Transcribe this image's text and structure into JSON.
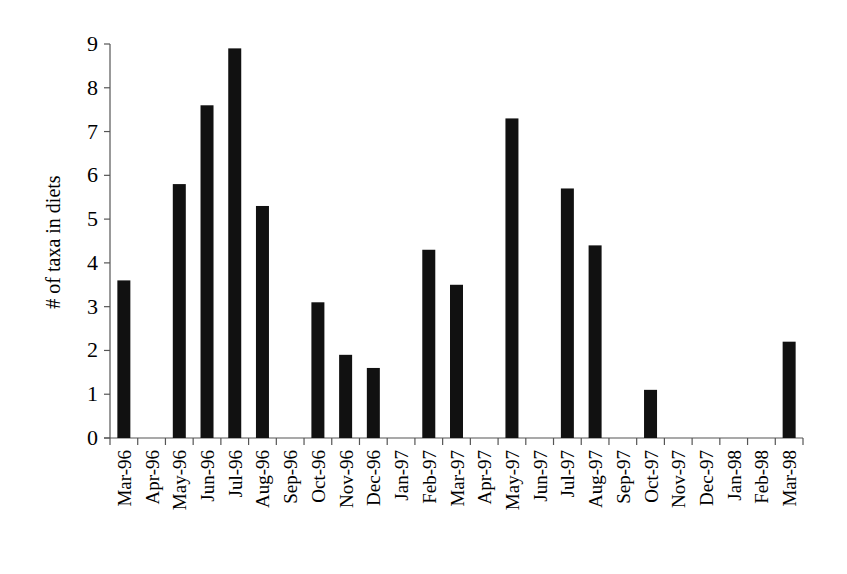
{
  "chart_data": {
    "type": "bar",
    "title": "",
    "xlabel": "",
    "ylabel": "# of taxa in diets",
    "ylim": [
      0,
      9
    ],
    "yticks": [
      0,
      1,
      2,
      3,
      4,
      5,
      6,
      7,
      8,
      9
    ],
    "grid": false,
    "legend": null,
    "bar_color": "#111111",
    "categories": [
      "Mar-96",
      "Apr-96",
      "May-96",
      "Jun-96",
      "Jul-96",
      "Aug-96",
      "Sep-96",
      "Oct-96",
      "Nov-96",
      "Dec-96",
      "Jan-97",
      "Feb-97",
      "Mar-97",
      "Apr-97",
      "May-97",
      "Jun-97",
      "Jul-97",
      "Aug-97",
      "Sep-97",
      "Oct-97",
      "Nov-97",
      "Dec-97",
      "Jan-98",
      "Feb-98",
      "Mar-98"
    ],
    "values": [
      3.6,
      0,
      5.8,
      7.6,
      8.9,
      5.3,
      0,
      3.1,
      1.9,
      1.6,
      0,
      4.3,
      3.5,
      0,
      7.3,
      0,
      5.7,
      4.4,
      0,
      1.1,
      0,
      0,
      0,
      0,
      2.2
    ]
  }
}
